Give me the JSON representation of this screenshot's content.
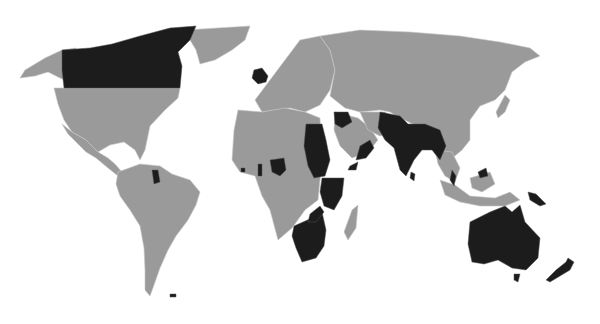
{
  "map": {
    "type": "world-choropleth",
    "projection": "equirectangular-like",
    "colors": {
      "background": "#ffffff",
      "land_default": "#9a9a9a",
      "land_highlight": "#1c1c1c",
      "border": "#c8c8c8"
    },
    "highlighted_countries": [
      "Canada",
      "United Kingdom",
      "Guyana",
      "Egypt",
      "Sudan",
      "Iraq",
      "Jordan",
      "Palestine",
      "Yemen (Aden)",
      "Oman",
      "India",
      "Pakistan",
      "Bangladesh",
      "Myanmar",
      "Sri Lanka",
      "Malaysia",
      "Nigeria",
      "Ghana",
      "Sierra Leone",
      "Gambia",
      "Kenya",
      "Uganda",
      "Tanzania",
      "Malawi",
      "Zambia",
      "Zimbabwe",
      "Botswana",
      "Namibia",
      "South Africa",
      "Lesotho",
      "Swaziland",
      "Somaliland",
      "Australia",
      "New Zealand",
      "Papua New Guinea",
      "Falkland Islands",
      "Belize",
      "Jamaica"
    ]
  }
}
